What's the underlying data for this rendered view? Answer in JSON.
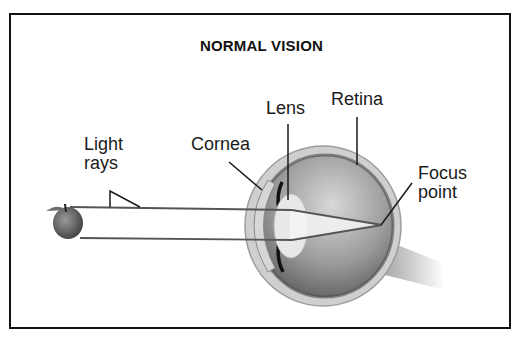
{
  "title": "NORMAL VISION",
  "labels": {
    "light_rays": [
      "Light",
      "rays"
    ],
    "cornea": "Cornea",
    "lens": "Lens",
    "retina": "Retina",
    "focus_point": [
      "Focus",
      "point"
    ]
  },
  "colors": {
    "border": "#111111",
    "text": "#1a1a1a",
    "eye_outer": "#bdbdbd",
    "eye_inner": "#8a8a8a",
    "lens": "#e6e6e6"
  }
}
